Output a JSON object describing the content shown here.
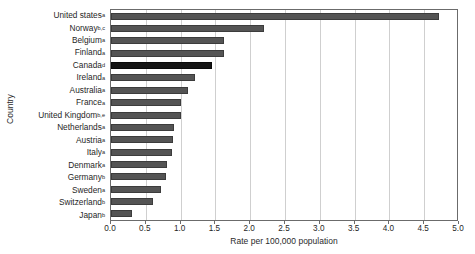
{
  "chart_data": {
    "type": "bar",
    "orientation": "horizontal",
    "title": "",
    "xlabel": "Rate per 100,000 population",
    "ylabel": "Country",
    "xlim": [
      0.0,
      5.0
    ],
    "xticks": [
      "0.0",
      "0.5",
      "1.0",
      "1.5",
      "2.0",
      "2.5",
      "3.0",
      "3.5",
      "4.0",
      "4.5",
      "5.0"
    ],
    "xtick_values": [
      0.0,
      0.5,
      1.0,
      1.5,
      2.0,
      2.5,
      3.0,
      3.5,
      4.0,
      4.5,
      5.0
    ],
    "grid": "vertical",
    "legend": "none",
    "categories": [
      "United states",
      "Norway",
      "Belgium",
      "Finland",
      "Canada",
      "Ireland",
      "Australia",
      "France",
      "United Kingdom",
      "Netherlands",
      "Austria",
      "Italy",
      "Denmark",
      "Germany",
      "Sweden",
      "Switzerland",
      "Japan"
    ],
    "footnotes": [
      "a",
      "b,c",
      "a",
      "a",
      "d",
      "a",
      "a",
      "a",
      "b,e",
      "a",
      "a",
      "a",
      "a",
      "b",
      "a",
      "b",
      "b"
    ],
    "values": [
      4.71,
      2.2,
      1.62,
      1.62,
      1.45,
      1.2,
      1.1,
      1.0,
      1.0,
      0.9,
      0.89,
      0.88,
      0.8,
      0.79,
      0.72,
      0.6,
      0.3
    ],
    "highlight_index": 4,
    "colors": {
      "bar": "#545454",
      "bar_highlight": "#141414",
      "bar_border": "#3c3c3c",
      "gridline": "#cfcfcf",
      "axis": "#6b6b6b",
      "background": "#ffffff",
      "text": "#1f1f1f"
    }
  }
}
